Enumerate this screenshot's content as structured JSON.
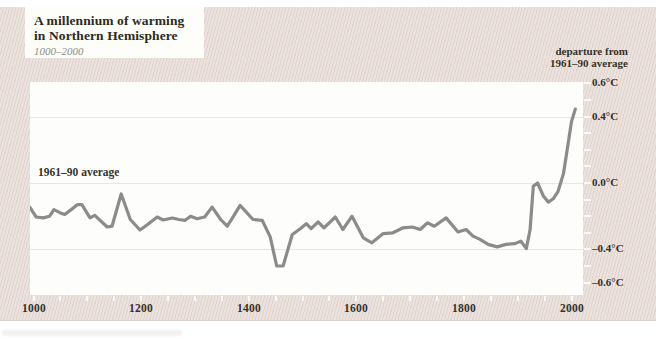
{
  "figure": {
    "title_line1": "A millennium of warming",
    "title_line2": "in Northern Hemisphere",
    "subtitle": "1000–2000",
    "axis_note_line1": "departure from",
    "axis_note_line2": "1961–90 average",
    "baseline_label": "1961–90 average"
  },
  "colors": {
    "panel_background": "#ece2de",
    "panel_hatch": "#c6b2ac",
    "plot_background": "#fdfdfc",
    "line": "#8b8b89",
    "gridline": "#e8e6e0",
    "tick": "#faf7f4",
    "text_dark": "#2d2a22",
    "text_muted": "#8f8b84"
  },
  "chart_data": {
    "type": "line",
    "title": "A millennium of warming in Northern Hemisphere",
    "subtitle": "1000–2000",
    "xlabel": "year",
    "ylabel": "departure from 1961–90 average (°C)",
    "x_range": [
      1000,
      2000
    ],
    "ylim": [
      -0.66,
      0.61
    ],
    "grid": "horizontal gridlines at labeled values",
    "legend": "none",
    "x_tick_values": [
      1000,
      1200,
      1400,
      1600,
      1800,
      2000
    ],
    "x_tick_labels": [
      "1000",
      "1200",
      "1400",
      "1600",
      "1800",
      "2000"
    ],
    "x_minor_tick_step": 50,
    "y_tick_values": [
      0.6,
      0.4,
      0.0,
      -0.4,
      -0.6
    ],
    "y_tick_labels": [
      "0.6°C",
      "0.4°C",
      "0.0°C",
      "–0.4°C",
      "–0.6°C"
    ],
    "y_minor_tick_step": 0.1,
    "gridline_values": [
      0.4,
      0.0,
      -0.4
    ],
    "series": [
      {
        "name": "Northern Hemisphere temperature anomaly (smoothed)",
        "points": [
          [
            993,
            -0.145
          ],
          [
            1005,
            -0.205
          ],
          [
            1018,
            -0.21
          ],
          [
            1030,
            -0.2
          ],
          [
            1038,
            -0.16
          ],
          [
            1050,
            -0.18
          ],
          [
            1058,
            -0.19
          ],
          [
            1070,
            -0.16
          ],
          [
            1082,
            -0.13
          ],
          [
            1090,
            -0.13
          ],
          [
            1105,
            -0.21
          ],
          [
            1114,
            -0.195
          ],
          [
            1137,
            -0.265
          ],
          [
            1146,
            -0.26
          ],
          [
            1163,
            -0.066
          ],
          [
            1180,
            -0.22
          ],
          [
            1198,
            -0.283
          ],
          [
            1212,
            -0.25
          ],
          [
            1230,
            -0.205
          ],
          [
            1241,
            -0.223
          ],
          [
            1258,
            -0.211
          ],
          [
            1270,
            -0.22
          ],
          [
            1282,
            -0.225
          ],
          [
            1292,
            -0.2
          ],
          [
            1304,
            -0.215
          ],
          [
            1318,
            -0.205
          ],
          [
            1332,
            -0.145
          ],
          [
            1348,
            -0.22
          ],
          [
            1360,
            -0.26
          ],
          [
            1372,
            -0.2
          ],
          [
            1384,
            -0.135
          ],
          [
            1408,
            -0.22
          ],
          [
            1425,
            -0.225
          ],
          [
            1440,
            -0.325
          ],
          [
            1452,
            -0.5
          ],
          [
            1464,
            -0.5
          ],
          [
            1481,
            -0.31
          ],
          [
            1496,
            -0.275
          ],
          [
            1507,
            -0.245
          ],
          [
            1516,
            -0.275
          ],
          [
            1529,
            -0.235
          ],
          [
            1540,
            -0.27
          ],
          [
            1561,
            -0.205
          ],
          [
            1575,
            -0.28
          ],
          [
            1592,
            -0.2
          ],
          [
            1613,
            -0.33
          ],
          [
            1629,
            -0.36
          ],
          [
            1650,
            -0.305
          ],
          [
            1668,
            -0.3
          ],
          [
            1687,
            -0.27
          ],
          [
            1704,
            -0.265
          ],
          [
            1719,
            -0.28
          ],
          [
            1732,
            -0.24
          ],
          [
            1745,
            -0.26
          ],
          [
            1767,
            -0.21
          ],
          [
            1789,
            -0.295
          ],
          [
            1804,
            -0.28
          ],
          [
            1817,
            -0.32
          ],
          [
            1830,
            -0.34
          ],
          [
            1845,
            -0.37
          ],
          [
            1862,
            -0.385
          ],
          [
            1878,
            -0.37
          ],
          [
            1895,
            -0.365
          ],
          [
            1906,
            -0.35
          ],
          [
            1916,
            -0.395
          ],
          [
            1923,
            -0.28
          ],
          [
            1929,
            -0.02
          ],
          [
            1937,
            0.0
          ],
          [
            1948,
            -0.08
          ],
          [
            1957,
            -0.115
          ],
          [
            1966,
            -0.095
          ],
          [
            1975,
            -0.05
          ],
          [
            1985,
            0.055
          ],
          [
            1992,
            0.2
          ],
          [
            2000,
            0.37
          ],
          [
            2007,
            0.445
          ]
        ]
      }
    ]
  }
}
